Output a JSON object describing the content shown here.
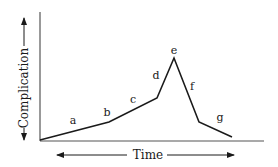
{
  "diagram": {
    "type": "line-diagram",
    "x_axis_label": "Time",
    "y_axis_label": "Complication",
    "line_color": "#1a1a1a",
    "axis_color": "#555555",
    "points": [
      {
        "x": 40,
        "y": 140
      },
      {
        "x": 109,
        "y": 122
      },
      {
        "x": 157,
        "y": 98
      },
      {
        "x": 174,
        "y": 58
      },
      {
        "x": 199,
        "y": 122
      },
      {
        "x": 232,
        "y": 137
      }
    ],
    "segment_labels": [
      {
        "id": "a",
        "text": "a",
        "x": 73,
        "y": 124
      },
      {
        "id": "b",
        "text": "b",
        "x": 107,
        "y": 116
      },
      {
        "id": "c",
        "text": "c",
        "x": 133,
        "y": 103
      },
      {
        "id": "d",
        "text": "d",
        "x": 156,
        "y": 79
      },
      {
        "id": "e",
        "text": "e",
        "x": 174,
        "y": 54
      },
      {
        "id": "f",
        "text": "f",
        "x": 192,
        "y": 90
      },
      {
        "id": "g",
        "text": "g",
        "x": 220,
        "y": 121
      }
    ]
  }
}
